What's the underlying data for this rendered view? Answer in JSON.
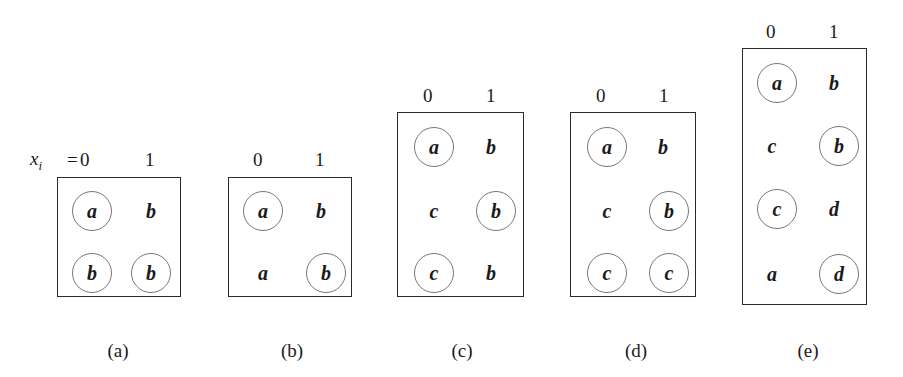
{
  "figure": {
    "variable_label": "x",
    "variable_subscript": "i",
    "equals": "=",
    "panels": [
      {
        "id": "a",
        "caption": "(a)",
        "columns": [
          "0",
          "1"
        ],
        "rows": [
          [
            {
              "v": "a",
              "circled": true
            },
            {
              "v": "b",
              "circled": false
            }
          ],
          [
            {
              "v": "b",
              "circled": true
            },
            {
              "v": "b",
              "circled": true
            }
          ]
        ]
      },
      {
        "id": "b",
        "caption": "(b)",
        "columns": [
          "0",
          "1"
        ],
        "rows": [
          [
            {
              "v": "a",
              "circled": true
            },
            {
              "v": "b",
              "circled": false
            }
          ],
          [
            {
              "v": "a",
              "circled": false
            },
            {
              "v": "b",
              "circled": true
            }
          ]
        ]
      },
      {
        "id": "c",
        "caption": "(c)",
        "columns": [
          "0",
          "1"
        ],
        "rows": [
          [
            {
              "v": "a",
              "circled": true
            },
            {
              "v": "b",
              "circled": false
            }
          ],
          [
            {
              "v": "c",
              "circled": false
            },
            {
              "v": "b",
              "circled": true
            }
          ],
          [
            {
              "v": "c",
              "circled": true
            },
            {
              "v": "b",
              "circled": false
            }
          ]
        ]
      },
      {
        "id": "d",
        "caption": "(d)",
        "columns": [
          "0",
          "1"
        ],
        "rows": [
          [
            {
              "v": "a",
              "circled": true
            },
            {
              "v": "b",
              "circled": false
            }
          ],
          [
            {
              "v": "c",
              "circled": false
            },
            {
              "v": "b",
              "circled": true
            }
          ],
          [
            {
              "v": "c",
              "circled": true
            },
            {
              "v": "c",
              "circled": true
            }
          ]
        ]
      },
      {
        "id": "e",
        "caption": "(e)",
        "columns": [
          "0",
          "1"
        ],
        "rows": [
          [
            {
              "v": "a",
              "circled": true
            },
            {
              "v": "b",
              "circled": false
            }
          ],
          [
            {
              "v": "c",
              "circled": false
            },
            {
              "v": "b",
              "circled": true
            }
          ],
          [
            {
              "v": "c",
              "circled": true
            },
            {
              "v": "d",
              "circled": false
            }
          ],
          [
            {
              "v": "a",
              "circled": false
            },
            {
              "v": "d",
              "circled": true
            }
          ]
        ]
      }
    ]
  }
}
